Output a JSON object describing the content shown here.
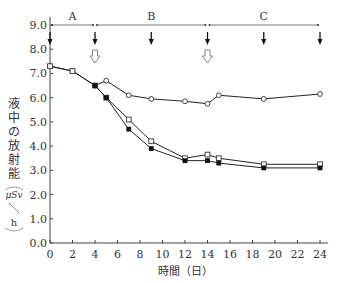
{
  "chart_data": {
    "type": "line",
    "title": "",
    "xlabel": "時間（日）",
    "ylabel": "液中の放射能",
    "yunit_num": "μSv",
    "yunit_den": "h",
    "xlim": [
      0,
      24
    ],
    "ylim": [
      0,
      9.0
    ],
    "xticks": [
      0,
      2,
      4,
      6,
      8,
      10,
      12,
      14,
      16,
      18,
      20,
      22,
      24
    ],
    "yticks": [
      "0.0",
      "1.0",
      "2.0",
      "3.0",
      "4.0",
      "5.0",
      "6.0",
      "7.0",
      "8.0",
      "9.0"
    ],
    "grid": false,
    "phases": [
      {
        "label": "A",
        "start": 0,
        "end": 4
      },
      {
        "label": "B",
        "start": 4,
        "end": 14
      },
      {
        "label": "C",
        "start": 14,
        "end": 24
      }
    ],
    "solid_arrows_x": [
      0,
      4,
      9,
      14,
      19,
      24
    ],
    "open_arrows_x": [
      4,
      14
    ],
    "series": [
      {
        "name": "open-circle",
        "marker": "circle-open",
        "x": [
          0,
          2,
          4,
          5,
          7,
          9,
          12,
          14,
          15,
          19,
          24
        ],
        "y": [
          7.3,
          7.1,
          6.5,
          6.7,
          6.1,
          5.95,
          5.85,
          5.75,
          6.1,
          5.95,
          6.15
        ]
      },
      {
        "name": "open-square",
        "marker": "square-open",
        "x": [
          0,
          2,
          4,
          5,
          7,
          9,
          12,
          14,
          15,
          19,
          24
        ],
        "y": [
          7.3,
          7.1,
          6.5,
          6.0,
          5.1,
          4.2,
          3.5,
          3.65,
          3.5,
          3.25,
          3.25
        ]
      },
      {
        "name": "filled-square",
        "marker": "square-filled",
        "x": [
          4,
          5,
          7,
          9,
          12,
          14,
          15,
          19,
          24
        ],
        "y": [
          6.5,
          6.0,
          4.7,
          3.9,
          3.4,
          3.4,
          3.3,
          3.1,
          3.1
        ]
      }
    ]
  }
}
